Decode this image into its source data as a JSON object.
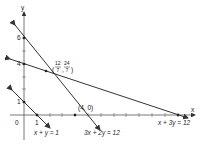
{
  "axes": {
    "x_label": "x",
    "y_label": "y",
    "origin_label": "0",
    "y_tick_labels": [
      "1",
      "4",
      "6"
    ],
    "x_tick_labels": [
      "1"
    ]
  },
  "lines": [
    {
      "equation": "x + y = 1",
      "x_intercept": 1,
      "y_intercept": 1
    },
    {
      "equation": "3x + 2y = 12",
      "x_intercept": 4,
      "y_intercept": 6
    },
    {
      "equation": "x + 3y = 12",
      "x_intercept": 12,
      "y_intercept": 4
    }
  ],
  "points": [
    {
      "label": "(4, 0)",
      "x": 4,
      "y": 0
    },
    {
      "label": "(12/7, 24/7)",
      "x_num": "12",
      "x_den": "7",
      "y_num": "24",
      "y_den": "7"
    }
  ],
  "labels": {
    "line1": "x + y = 1",
    "line2": "3x + 2y = 12",
    "line3": "x + 3y = 12",
    "point_4_0": "(4, 0)",
    "intersect_x_num": "12",
    "intersect_x_den": "7",
    "intersect_y_num": "24",
    "intersect_y_den": "7"
  }
}
